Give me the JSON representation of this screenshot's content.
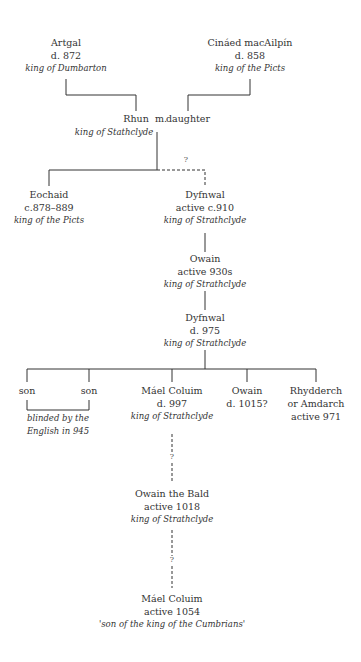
{
  "nodes": {
    "artgal": {
      "name": "Artgal",
      "date": "d. 872",
      "title": "king of Dumbarton"
    },
    "cinaed": {
      "name": "Cináed macAilpín",
      "date": "d. 858",
      "title": "king of the Picts"
    },
    "rhun": {
      "name": "Rhun",
      "marriage": "m.",
      "spouse": "daughter",
      "title": "king of Stathclyde"
    },
    "eochaid": {
      "name": "Eochaid",
      "date": "c.878–889",
      "title": "king of the Picts"
    },
    "dyfnwal1": {
      "name": "Dyfnwal",
      "date": "active c.910",
      "title": "king of Strathclyde"
    },
    "owain1": {
      "name": "Owain",
      "date": "active 930s",
      "title": "king of Strathclyde"
    },
    "dyfnwal2": {
      "name": "Dyfnwal",
      "date": "d. 975",
      "title": "king of Strathclyde"
    },
    "son1": {
      "name": "son"
    },
    "son2": {
      "name": "son"
    },
    "sons_note": {
      "line1": "blinded by the",
      "line2": "English in 945"
    },
    "mael1": {
      "name": "Máel Coluim",
      "date": "d. 997",
      "title": "king of Strathclyde"
    },
    "owain2": {
      "name": "Owain",
      "date": "d. 1015?"
    },
    "rhydderch": {
      "name": "Rhydderch",
      "alt": "or Amdarch",
      "date": "active 971"
    },
    "owain_bald": {
      "name": "Owain the Bald",
      "date": "active 1018",
      "title": "king of Strathclyde"
    },
    "mael2": {
      "name": "Máel Coluim",
      "date": "active 1054",
      "title": "'son of the king of the Cumbrians'"
    }
  },
  "uncertain_marker": "?"
}
